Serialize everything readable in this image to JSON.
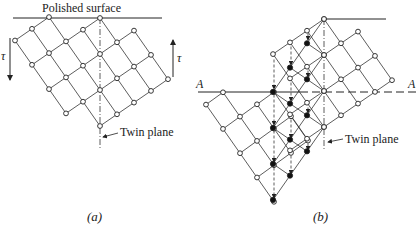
{
  "figure_a": {
    "surface_label": "Polished surface",
    "twin_plane_label": "Twin plane",
    "shear_label_left": "τ",
    "shear_label_right": "τ",
    "caption": "(a)",
    "lattice": {
      "origin": [
        100,
        18
      ],
      "u": [
        -17,
        11.7
      ],
      "v": [
        17,
        24.3
      ],
      "nodes": [
        [
          2,
          -1
        ],
        [
          3,
          -1
        ],
        [
          4,
          -1
        ],
        [
          0,
          0
        ],
        [
          1,
          0
        ],
        [
          2,
          0
        ],
        [
          3,
          0
        ],
        [
          4,
          0
        ],
        [
          -1,
          1
        ],
        [
          0,
          1
        ],
        [
          1,
          1
        ],
        [
          2,
          1
        ],
        [
          3,
          1
        ],
        [
          4,
          1
        ],
        [
          -1,
          2
        ],
        [
          0,
          2
        ],
        [
          1,
          2
        ],
        [
          2,
          2
        ],
        [
          3,
          2
        ],
        [
          4,
          2
        ],
        [
          -1,
          3
        ],
        [
          0,
          3
        ],
        [
          1,
          3
        ],
        [
          2,
          3
        ],
        [
          3,
          3
        ]
      ]
    }
  },
  "figure_b": {
    "plane_label_left": "A",
    "plane_label_right": "A",
    "twin_plane_label": "Twin plane",
    "caption": "(b)",
    "parent_lattice": {
      "origin": [
        324,
        19
      ],
      "u": [
        -17,
        11.7
      ],
      "v": [
        17,
        24.3
      ],
      "nodes": [
        [
          0,
          0
        ],
        [
          1,
          0
        ],
        [
          2,
          0
        ],
        [
          3,
          0
        ],
        [
          -1,
          1
        ],
        [
          0,
          1
        ],
        [
          1,
          1
        ],
        [
          2,
          1
        ],
        [
          3,
          1
        ],
        [
          -1,
          2
        ],
        [
          0,
          2
        ],
        [
          1,
          2
        ],
        [
          2,
          2
        ],
        [
          3,
          2
        ],
        [
          4,
          2
        ],
        [
          -1,
          3
        ],
        [
          0,
          3
        ],
        [
          1,
          3
        ],
        [
          2,
          3
        ],
        [
          3,
          3
        ],
        [
          4,
          3
        ],
        [
          5,
          3
        ]
      ]
    },
    "twinned_lattice": {
      "origin": [
        324,
        19
      ],
      "u": [
        17,
        11.7
      ],
      "v": [
        -17,
        24.3
      ],
      "nodes": [
        [
          0,
          0
        ],
        [
          0,
          1
        ],
        [
          0,
          2
        ],
        [
          0,
          3
        ],
        [
          1,
          1
        ],
        [
          1,
          2
        ],
        [
          1,
          3
        ],
        [
          1,
          4
        ],
        [
          2,
          2
        ],
        [
          2,
          3
        ],
        [
          2,
          4
        ],
        [
          2,
          5
        ],
        [
          3,
          3
        ],
        [
          3,
          4
        ],
        [
          3,
          5
        ],
        [
          3,
          6
        ]
      ],
      "open_nodes": [
        [
          0,
          0
        ],
        [
          1,
          1
        ],
        [
          2,
          2
        ],
        [
          3,
          3
        ]
      ]
    },
    "lower_lattice": {
      "origin": [
        274,
        92
      ],
      "u": [
        -17,
        12.3
      ],
      "v": [
        17,
        24.3
      ],
      "nodes": [
        [
          2,
          -1
        ],
        [
          3,
          -1
        ],
        [
          0,
          0
        ],
        [
          1,
          0
        ],
        [
          2,
          0
        ],
        [
          3,
          0
        ],
        [
          0,
          1
        ],
        [
          1,
          1
        ],
        [
          2,
          1
        ],
        [
          3,
          1
        ],
        [
          0,
          2
        ],
        [
          1,
          2
        ],
        [
          2,
          2
        ],
        [
          3,
          2
        ],
        [
          3,
          3
        ]
      ]
    },
    "displacement_arrows": [
      [
        274,
        57,
        274,
        92
      ],
      [
        274,
        92,
        274,
        128
      ],
      [
        274,
        128,
        274,
        165
      ],
      [
        274,
        165,
        274,
        201
      ],
      [
        291,
        44,
        291,
        68
      ],
      [
        291,
        80,
        291,
        104
      ],
      [
        291,
        117,
        291,
        141
      ],
      [
        291,
        153,
        291,
        177
      ],
      [
        308,
        31,
        308,
        43
      ],
      [
        308,
        68,
        308,
        80
      ],
      [
        308,
        105,
        308,
        116
      ],
      [
        308,
        141,
        308,
        153
      ]
    ]
  }
}
